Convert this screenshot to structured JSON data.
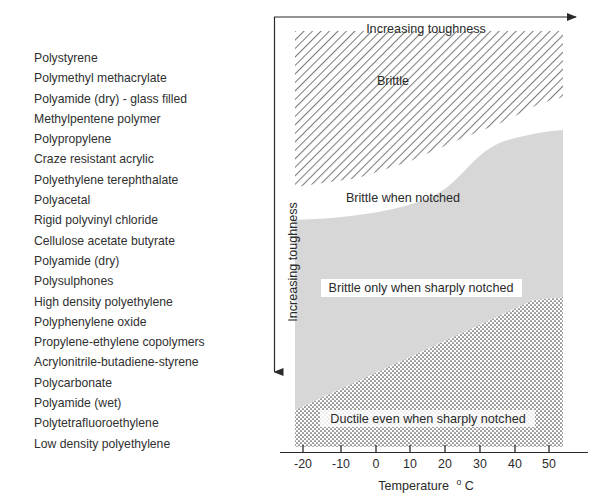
{
  "polymer_list": {
    "items": [
      "Polystyrene",
      "Polymethyl methacrylate",
      "Polyamide (dry) - glass filled",
      "Methylpentene polymer",
      "Polypropylene",
      "Craze resistant acrylic",
      "Polyethylene terephthalate",
      "Polyacetal",
      "Rigid polyvinyl chloride",
      "Cellulose acetate butyrate",
      "Polyamide (dry)",
      "Polysulphones",
      "High density polyethylene",
      "Polyphenylene oxide",
      "Propylene-ethylene copolymers",
      "Acrylonitrile-butadiene-styrene",
      "Polycarbonate",
      "Polyamide (wet)",
      "Polytetrafluoroethylene",
      "Low density polyethylene"
    ]
  },
  "chart_data": {
    "type": "area",
    "title": "",
    "xlabel": "Temperature",
    "xlabel_unit": "°C",
    "ylabel": "Increasing toughness",
    "top_axis_label": "Increasing toughness",
    "xlim": [
      -25,
      55
    ],
    "ticks": [
      "-20",
      "-10",
      "0",
      "10",
      "20",
      "30",
      "40",
      "50"
    ],
    "tick_values": [
      -20,
      -10,
      0,
      10,
      20,
      30,
      40,
      50
    ],
    "grid": false,
    "legend_position": "none",
    "regions": [
      {
        "name": "brittle",
        "label": "Brittle",
        "fill": "diagonal-hatch",
        "color": "#8a8a8a",
        "order": 1
      },
      {
        "name": "brittle-when-notched",
        "label": "Brittle when notched",
        "fill": "white",
        "color": "#ffffff",
        "order": 2
      },
      {
        "name": "brittle-only-when-sharply-notched",
        "label": "Brittle only when sharply notched",
        "fill": "light-gray",
        "color": "#d6d6d6",
        "order": 3
      },
      {
        "name": "ductile-even-when-sharply-notched",
        "label": "Ductile even when sharply notched",
        "fill": "dotted",
        "color": "#4a4a4a",
        "order": 4
      }
    ]
  },
  "colors": {
    "axis": "#2a2a2a",
    "text": "#2a2a2a",
    "hatch": "#7d7d7d",
    "gray_fill": "#d7d7d7",
    "dot_fill": "#505050",
    "background": "#ffffff"
  }
}
